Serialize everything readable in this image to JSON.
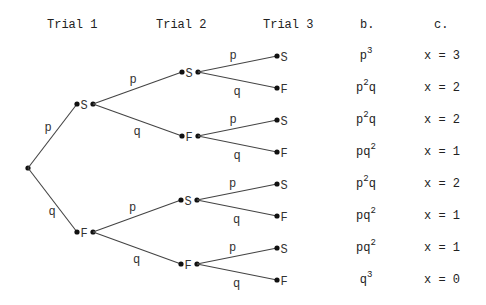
{
  "headers": {
    "trial1": "Trial 1",
    "trial2": "Trial 2",
    "trial3": "Trial 3",
    "col_b": "b.",
    "col_c": "c."
  },
  "tree": {
    "root": {
      "x": 28,
      "y": 168
    },
    "trial1": [
      {
        "label": "S",
        "lx": 77,
        "rx": 93,
        "y": 104,
        "edge_label": "p"
      },
      {
        "label": "F",
        "lx": 77,
        "rx": 93,
        "y": 232,
        "edge_label": "q"
      }
    ],
    "trial2": [
      {
        "label": "S",
        "lx": 182,
        "rx": 198,
        "y": 72,
        "parent": 0,
        "edge_label": "p"
      },
      {
        "label": "F",
        "lx": 182,
        "rx": 198,
        "y": 136,
        "parent": 0,
        "edge_label": "q"
      },
      {
        "label": "S",
        "lx": 181,
        "rx": 197,
        "y": 200,
        "parent": 1,
        "edge_label": "p"
      },
      {
        "label": "F",
        "lx": 181,
        "rx": 197,
        "y": 264,
        "parent": 1,
        "edge_label": "q"
      }
    ],
    "trial3": [
      {
        "label": "S",
        "x": 277,
        "y": 56,
        "parent": 0,
        "edge_label": "p"
      },
      {
        "label": "F",
        "x": 277,
        "y": 88,
        "parent": 0,
        "edge_label": "q"
      },
      {
        "label": "S",
        "x": 277,
        "y": 120,
        "parent": 1,
        "edge_label": "p"
      },
      {
        "label": "F",
        "x": 277,
        "y": 152,
        "parent": 1,
        "edge_label": "q"
      },
      {
        "label": "S",
        "x": 277,
        "y": 184,
        "parent": 2,
        "edge_label": "p"
      },
      {
        "label": "F",
        "x": 277,
        "y": 216,
        "parent": 2,
        "edge_label": "q"
      },
      {
        "label": "S",
        "x": 277,
        "y": 248,
        "parent": 3,
        "edge_label": "p"
      },
      {
        "label": "F",
        "x": 277,
        "y": 280,
        "parent": 3,
        "edge_label": "q"
      }
    ]
  },
  "outcomes": [
    {
      "base": "p",
      "exp": "3",
      "tail": "",
      "x_text": "x = 3"
    },
    {
      "base": "p",
      "exp": "2",
      "tail": "q",
      "x_text": "x = 2"
    },
    {
      "base": "p",
      "exp": "2",
      "tail": "q",
      "x_text": "x = 2"
    },
    {
      "base": "pq",
      "exp": "2",
      "tail": "",
      "x_text": "x = 1"
    },
    {
      "base": "p",
      "exp": "2",
      "tail": "q",
      "x_text": "x = 2"
    },
    {
      "base": "pq",
      "exp": "2",
      "tail": "",
      "x_text": "x = 1"
    },
    {
      "base": "pq",
      "exp": "2",
      "tail": "",
      "x_text": "x = 1"
    },
    {
      "base": "q",
      "exp": "3",
      "tail": "",
      "x_text": "x = 0"
    }
  ]
}
